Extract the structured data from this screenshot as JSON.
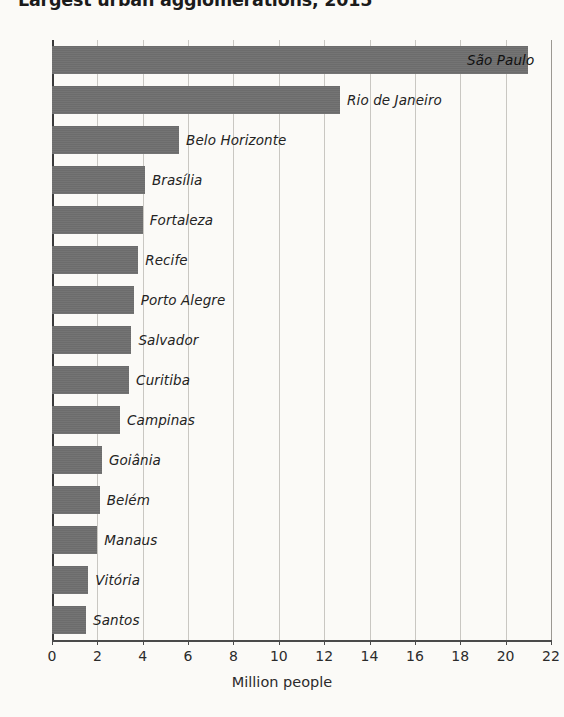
{
  "chart_data": {
    "type": "bar",
    "orientation": "horizontal",
    "title": "Largest urban agglomerations, 2015",
    "xlabel": "Million people",
    "ylabel": "",
    "xlim": [
      0,
      22
    ],
    "xticks": [
      0,
      2,
      4,
      6,
      8,
      10,
      12,
      14,
      16,
      18,
      20,
      22
    ],
    "grid": "vertical",
    "legend": "none",
    "bar_color": "#6f6f6f",
    "background_color": "#fbfaf7",
    "gridline_color": "#c9c7c2",
    "axis_color": "#4a4a4a",
    "categories": [
      "São Paulo",
      "Rio de Janeiro",
      "Belo Horizonte",
      "Brasília",
      "Fortaleza",
      "Recife",
      "Porto Alegre",
      "Salvador",
      "Curitiba",
      "Campinas",
      "Goiânia",
      "Belém",
      "Manaus",
      "Vitória",
      "Santos"
    ],
    "values": [
      21.0,
      12.7,
      5.6,
      4.1,
      4.0,
      3.8,
      3.6,
      3.5,
      3.4,
      3.0,
      2.2,
      2.1,
      2.0,
      1.6,
      1.5
    ],
    "label_placement": [
      "inside",
      "outside",
      "outside",
      "outside",
      "outside",
      "outside",
      "outside",
      "outside",
      "outside",
      "outside",
      "outside",
      "outside",
      "outside",
      "outside",
      "outside"
    ]
  }
}
